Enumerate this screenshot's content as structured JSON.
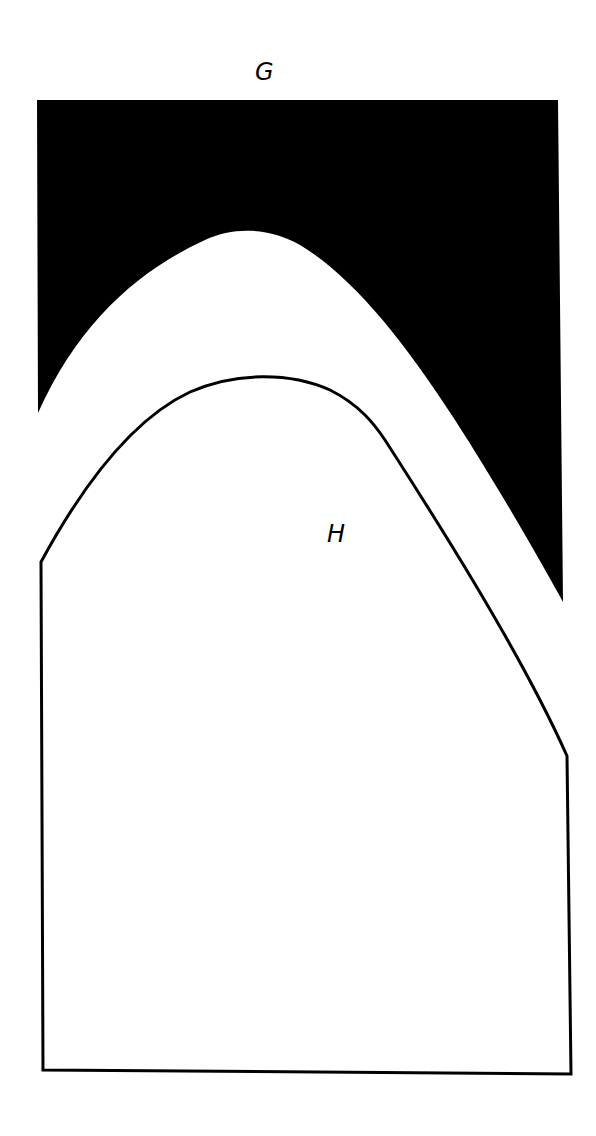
{
  "diagram": {
    "labels": {
      "top": "G",
      "shape": "H"
    },
    "colors": {
      "fill_dark": "#000000",
      "outline": "#000000",
      "background": "#ffffff"
    },
    "regions": [
      {
        "id": "G",
        "description": "Solid black region with curved lower edge (arch cutout)"
      },
      {
        "id": "H",
        "description": "Outlined shape with arched top and rectangular base"
      }
    ]
  }
}
